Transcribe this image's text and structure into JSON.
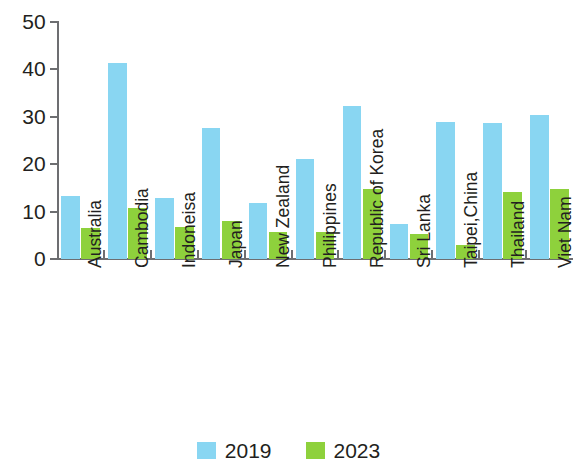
{
  "chart_data": {
    "type": "bar",
    "title": "",
    "subtitle": "",
    "xlabel": "",
    "ylabel": "",
    "ylim": [
      0,
      50
    ],
    "yticks": [
      0,
      10,
      20,
      30,
      40,
      50
    ],
    "grid": false,
    "legend_position": "bottom",
    "categories": [
      "Australia",
      "Cambodia",
      "Indoneisa",
      "Japan",
      "New Zealand",
      "Philippines",
      "Republic of Korea",
      "Sri Lanka",
      "Taipei,China",
      "Thailand",
      "Viet Nam"
    ],
    "series": [
      {
        "name": "2019",
        "color": "#89d6f2",
        "values": [
          13.3,
          41.4,
          12.9,
          27.6,
          11.9,
          21.2,
          32.3,
          7.4,
          28.9,
          28.6,
          30.4
        ]
      },
      {
        "name": "2023",
        "color": "#8ed13c",
        "values": [
          6.5,
          10.8,
          6.8,
          8.0,
          5.7,
          5.7,
          14.8,
          5.2,
          3.0,
          14.1,
          14.8
        ]
      }
    ]
  },
  "axis": {
    "tick_labels": [
      "50",
      "40",
      "30",
      "20",
      "10",
      "0"
    ]
  },
  "legend": {
    "items": [
      {
        "label": "2019",
        "color": "#89d6f2"
      },
      {
        "label": "2023",
        "color": "#8ed13c"
      }
    ]
  }
}
